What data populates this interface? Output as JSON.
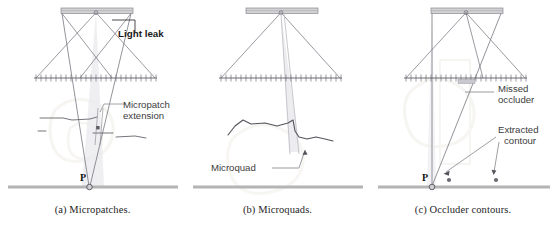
{
  "figure": {
    "background_color": "#ffffff",
    "panels": [
      {
        "id": "a",
        "caption": "(a) Micropatches.",
        "annotations": [
          {
            "name": "light-leak",
            "text": "Light leak"
          },
          {
            "name": "micropatch-extension-line1",
            "text": "Micropatch"
          },
          {
            "name": "micropatch-extension-line2",
            "text": "extension"
          }
        ],
        "point_label": "P"
      },
      {
        "id": "b",
        "caption": "(b) Microquads.",
        "annotations": [
          {
            "name": "microquad",
            "text": "Microquad"
          }
        ],
        "point_label": ""
      },
      {
        "id": "c",
        "caption": "(c) Occluder contours.",
        "annotations": [
          {
            "name": "missed-occluder-line1",
            "text": "Missed"
          },
          {
            "name": "missed-occluder-line2",
            "text": "occluder"
          },
          {
            "name": "extracted-contour-line1",
            "text": "Extracted"
          },
          {
            "name": "extracted-contour-line2",
            "text": "contour"
          }
        ],
        "point_label": "P"
      }
    ],
    "colors": {
      "ray_line": "#6f6f78",
      "light_bar_fill": "#d2d2d4",
      "light_bar_stroke": "#8a8a90",
      "occluder_line": "#5c5c64",
      "contour_line": "#55555c",
      "ground_line": "#b4b4b4",
      "leader_line": "#8d8d93",
      "faint_beam": "#dcdce0",
      "watermark": "#f2f0ec",
      "text": "#3c3c3c",
      "caption_text": "#252525"
    }
  }
}
